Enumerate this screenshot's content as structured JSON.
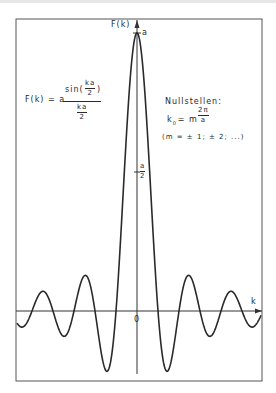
{
  "figure": {
    "y_axis_label": "F(k)",
    "x_axis_label": "k",
    "origin_label": "0",
    "peak_label": "a",
    "half_label": {
      "num": "a",
      "den": "2"
    },
    "formula": {
      "lhs": "F(k) = a",
      "num_prefix": "sin(",
      "num_frac": {
        "num": "ka",
        "den": "2"
      },
      "num_suffix": ")",
      "den_frac": {
        "num": "ka",
        "den": "2"
      }
    },
    "zeros": {
      "title": "Nullstellen:",
      "eq_lhs": "k",
      "eq_sub": "0",
      "eq_mid": "= m",
      "eq_frac": {
        "num": "2π",
        "den": "a"
      },
      "condition": "(m = ± 1; ± 2; ...)"
    },
    "colors": {
      "ink": "#2a2a2a",
      "background": "#ffffff"
    }
  },
  "chart_data": {
    "type": "line",
    "title": "",
    "function": "F(k) = a · sin(ka/2)/(ka/2)",
    "xlabel": "k",
    "ylabel": "F(k)",
    "annotations": [
      "a",
      "a/2",
      "0",
      "Nullstellen: k0 = m·2π/a",
      "(m = ±1; ±2; ...)"
    ],
    "y_ticks": [
      "a/2",
      "a"
    ],
    "x_range_in_units_of_2pi_over_a": [
      -5.8,
      5.8
    ],
    "y_range_in_units_of_a": [
      -0.3,
      1.0
    ],
    "zeros_at": "k = m·2π/a, m = ±1, ±2, ...",
    "grid": false
  }
}
